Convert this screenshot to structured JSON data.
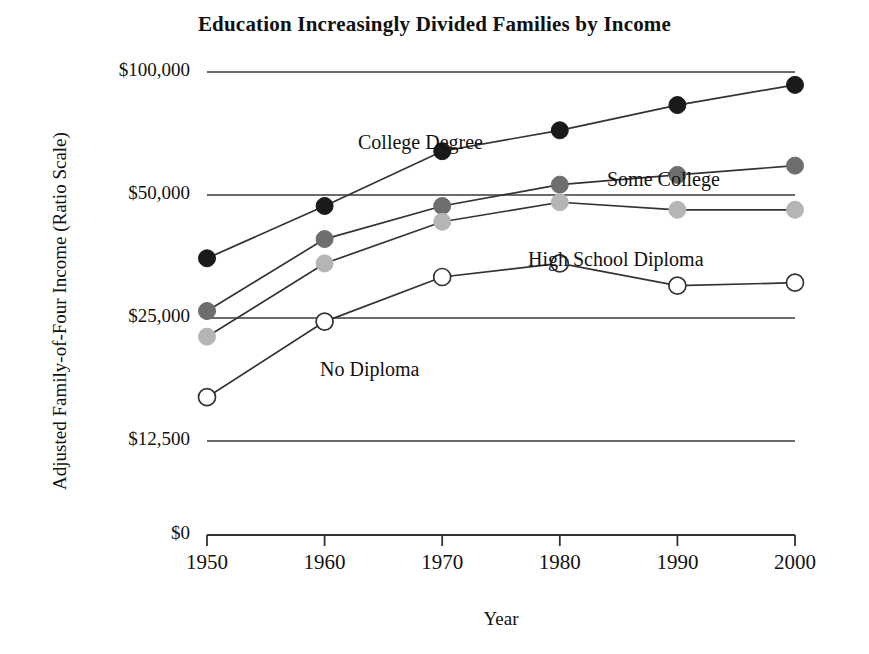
{
  "chart_data": {
    "type": "line",
    "title": "Education Increasingly Divided Families by Income",
    "xlabel": "Year",
    "ylabel": "Adjusted Family-of-Four Income (Ratio Scale)",
    "scale": "ratio (log base 2)",
    "grid": true,
    "legend_position": "inline-annotations",
    "categories": [
      1950,
      1960,
      1970,
      1980,
      1990,
      2000
    ],
    "x_tick_labels": [
      "1950",
      "1960",
      "1970",
      "1980",
      "1990",
      "2000"
    ],
    "y_tick_labels": [
      "$100,000",
      "$50,000",
      "$25,000",
      "$12,500",
      "$0"
    ],
    "y_tick_values": [
      100000,
      50000,
      25000,
      12500,
      0
    ],
    "ylim": [
      0,
      100000
    ],
    "xlim": [
      1950,
      2000
    ],
    "series": [
      {
        "name": "College Degree",
        "marker": "filled-black-circle",
        "color": "#1a1a1a",
        "values": [
          35000,
          47000,
          64000,
          72000,
          83000,
          93000
        ]
      },
      {
        "name": "Some College",
        "marker": "filled-dark-gray-circle",
        "color": "#6e6e6e",
        "values": [
          26000,
          39000,
          47000,
          53000,
          56000,
          59000
        ]
      },
      {
        "name": "High School Diploma",
        "marker": "filled-light-gray-circle",
        "color": "#b5b5b5",
        "values": [
          22500,
          34000,
          43000,
          48000,
          46000,
          46000
        ]
      },
      {
        "name": "No Diploma",
        "marker": "open-white-circle",
        "color": "#ffffff",
        "values": [
          16000,
          24500,
          31500,
          34000,
          30000,
          30500
        ]
      }
    ],
    "annotations": [
      {
        "text": "College Degree",
        "x": 358,
        "y": 131
      },
      {
        "text": "Some College",
        "x": 607,
        "y": 168
      },
      {
        "text": "High School Diploma",
        "x": 528,
        "y": 248
      },
      {
        "text": "No Diploma",
        "x": 320,
        "y": 358
      }
    ]
  },
  "axis": {
    "line_color": "#333333",
    "grid_color": "#3a3a3a"
  }
}
